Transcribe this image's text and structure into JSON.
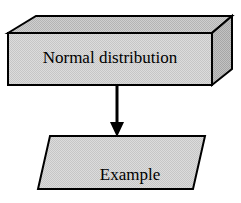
{
  "diagram": {
    "type": "flowchart",
    "orientation": "vertical",
    "background_color": "#ffffff",
    "nodes": [
      {
        "id": "normal-distribution",
        "shape": "cuboid-3d",
        "label": "Normal distribution",
        "fill_color": "#d4d4d4",
        "side_fill_color": "#b8b8b8",
        "top_fill_color": "#c9c9c9",
        "stroke_color": "#000000"
      },
      {
        "id": "example",
        "shape": "parallelogram",
        "label_line1": "Example",
        "label_line2": "19.10",
        "fill_color": "#d4d4d4",
        "stroke_color": "#000000"
      }
    ],
    "connectors": [
      {
        "id": "arrow-down",
        "from": "normal-distribution",
        "to": "example",
        "style": "solid-line-with-filled-arrowhead",
        "color": "#000000"
      }
    ]
  }
}
